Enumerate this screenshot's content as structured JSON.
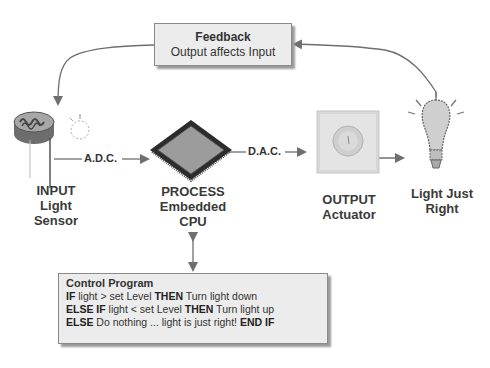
{
  "feedback": {
    "title": "Feedback",
    "subtitle": "Output affects Input"
  },
  "connectors": {
    "adc": "A.D.C.",
    "dac": "D.A.C."
  },
  "nodes": {
    "input": [
      "INPUT",
      "Light",
      "Sensor"
    ],
    "process": [
      "PROCESS",
      "Embedded",
      "CPU"
    ],
    "output": [
      "OUTPUT",
      "Actuator"
    ],
    "result": [
      "Light Just",
      "Right"
    ]
  },
  "program": {
    "title": "Control Program",
    "lines": [
      {
        "k1": "IF",
        "t1": " light > set Level ",
        "k2": "THEN",
        "t2": " Turn light down"
      },
      {
        "k1": "ELSE IF",
        "t1": " light < set Level ",
        "k2": "THEN",
        "t2": " Turn light up"
      },
      {
        "k1": "ELSE",
        "t1": " Do nothing ... light is just right!  ",
        "k2": "END IF",
        "t2": ""
      }
    ]
  },
  "icons": {
    "sensor": "light-dependent-resistor",
    "cpu": "microchip",
    "actuator": "dimmer-switch",
    "bulb": "light-bulb"
  },
  "colors": {
    "arrow": "#6f6f6f",
    "box_fill": "#ececec",
    "box_border": "#8a8a8a",
    "text": "#333333"
  }
}
